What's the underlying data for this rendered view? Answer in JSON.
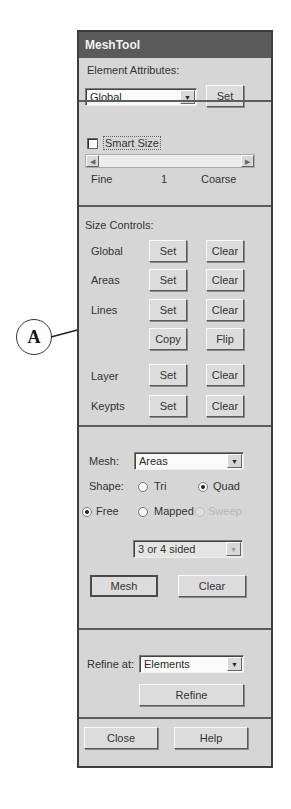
{
  "window": {
    "title": "MeshTool"
  },
  "element_attributes": {
    "label": "Element Attributes:",
    "combo_value": "Global",
    "set_button": "Set"
  },
  "smart_size": {
    "checkbox_label": "Smart Size",
    "checked": false,
    "slider_left_label": "Fine",
    "slider_value": "1",
    "slider_right_label": "Coarse"
  },
  "size_controls": {
    "label": "Size Controls:",
    "rows": [
      {
        "label": "Global",
        "set": "Set",
        "clear": "Clear"
      },
      {
        "label": "Areas",
        "set": "Set",
        "clear": "Clear"
      },
      {
        "label": "Lines",
        "set": "Set",
        "clear": "Clear"
      },
      {
        "label": "",
        "set": "Copy",
        "clear": "Flip"
      },
      {
        "label": "Layer",
        "set": "Set",
        "clear": "Clear"
      },
      {
        "label": "Keypts",
        "set": "Set",
        "clear": "Clear"
      }
    ]
  },
  "mesh": {
    "label": "Mesh:",
    "combo_value": "Areas",
    "shape_label": "Shape:",
    "shape_options": [
      {
        "label": "Tri",
        "selected": false
      },
      {
        "label": "Quad",
        "selected": true
      }
    ],
    "method_options": [
      {
        "label": "Free",
        "selected": true,
        "enabled": true
      },
      {
        "label": "Mapped",
        "selected": false,
        "enabled": true
      },
      {
        "label": "Sweep",
        "selected": false,
        "enabled": false
      }
    ],
    "sides_combo_value": "3 or 4 sided",
    "mesh_button": "Mesh",
    "clear_button": "Clear"
  },
  "refine": {
    "label": "Refine at:",
    "combo_value": "Elements",
    "refine_button": "Refine"
  },
  "footer": {
    "close_button": "Close",
    "help_button": "Help"
  },
  "annotation": {
    "callout_label": "A",
    "points_to": "Lines Set button"
  }
}
